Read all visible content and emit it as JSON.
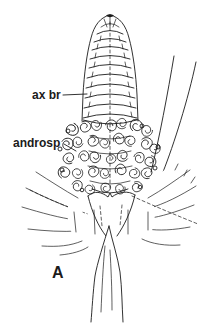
{
  "figure": {
    "kind": "botanical-line-drawing",
    "panel_label": "A",
    "annotations": {
      "ax_br": "ax br",
      "androsp": "androsp"
    },
    "colors": {
      "ink": "#1b1b1b",
      "background": "#ffffff"
    }
  }
}
